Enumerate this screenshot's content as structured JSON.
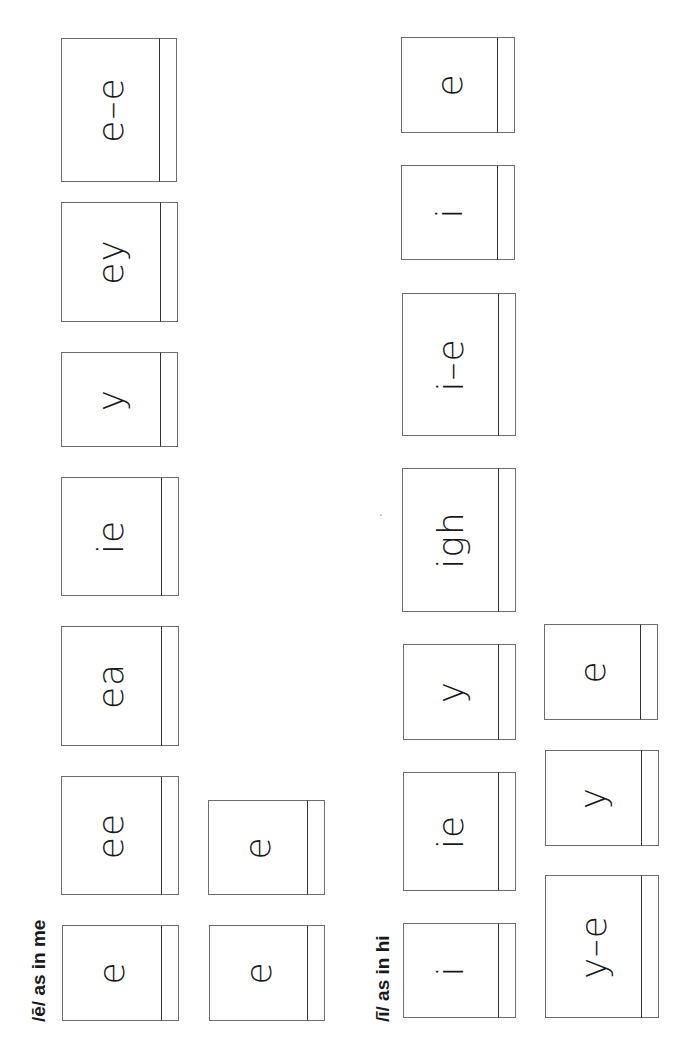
{
  "sections": [
    {
      "label": "/ē/ as in me",
      "cards": [
        {
          "text": "e",
          "box": [
            62,
            925,
            117,
            96
          ]
        },
        {
          "text": "e",
          "box": [
            209,
            925,
            116,
            96
          ]
        },
        {
          "text": "ee",
          "box": [
            61,
            776,
            118,
            119
          ]
        },
        {
          "text": "e",
          "box": [
            208,
            800,
            117,
            95
          ]
        },
        {
          "text": "ea",
          "box": [
            61,
            626,
            118,
            120
          ]
        },
        {
          "text": "ie",
          "box": [
            61,
            477,
            118,
            119
          ]
        },
        {
          "text": "y",
          "box": [
            61,
            352,
            117,
            95
          ]
        },
        {
          "text": "ey",
          "box": [
            61,
            202,
            117,
            120
          ]
        },
        {
          "text": "e–e",
          "box": [
            61,
            38,
            116,
            144
          ]
        }
      ]
    },
    {
      "label": "/ī/ as in hi",
      "cards": [
        {
          "text": "i",
          "box": [
            403,
            923,
            113,
            95
          ]
        },
        {
          "text": "ie",
          "box": [
            403,
            772,
            113,
            119
          ]
        },
        {
          "text": "y",
          "box": [
            403,
            644,
            113,
            96
          ]
        },
        {
          "text": "igh",
          "box": [
            402,
            468,
            114,
            144
          ]
        },
        {
          "text": "i–e",
          "box": [
            402,
            293,
            114,
            143
          ]
        },
        {
          "text": "i",
          "box": [
            401,
            165,
            114,
            95
          ]
        },
        {
          "text": "e",
          "box": [
            401,
            37,
            114,
            96
          ]
        },
        {
          "text": "y–e",
          "box": [
            545,
            875,
            114,
            143
          ]
        },
        {
          "text": "y",
          "box": [
            545,
            750,
            114,
            96
          ]
        },
        {
          "text": "e",
          "box": [
            544,
            624,
            114,
            96
          ]
        }
      ]
    }
  ]
}
